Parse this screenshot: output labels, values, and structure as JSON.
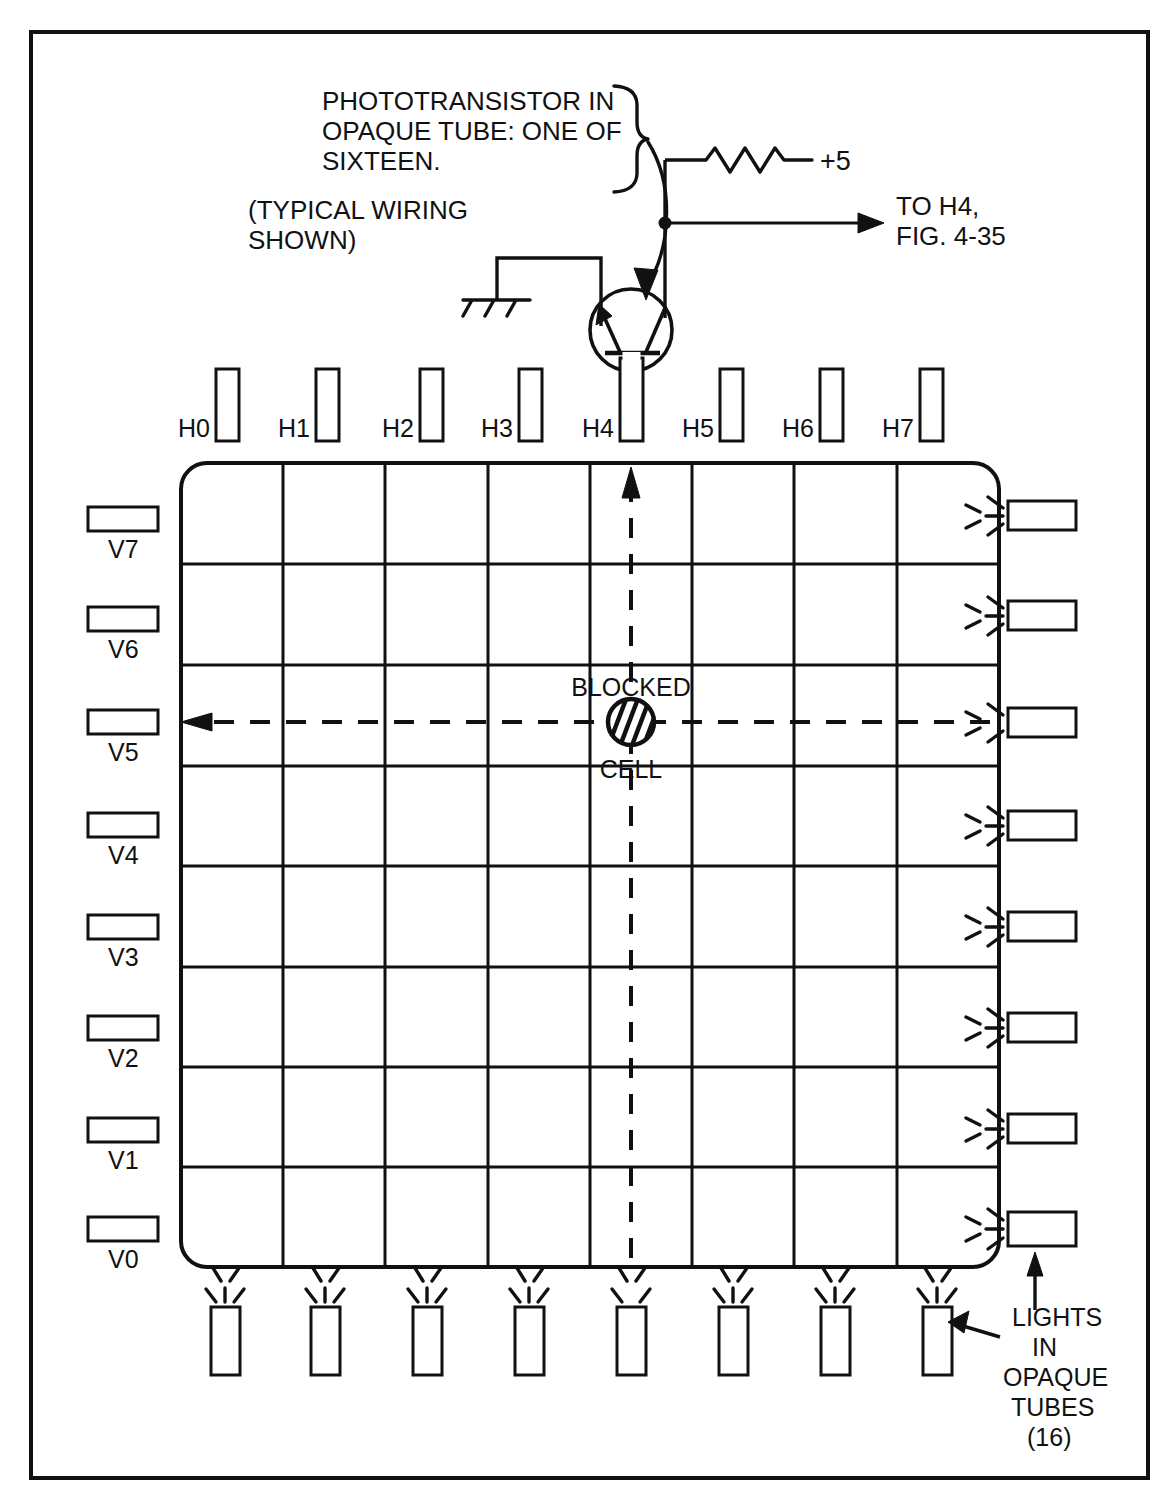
{
  "figure": {
    "frame": {
      "name": "outer-border"
    }
  },
  "callout": {
    "phototransistor_note": [
      "PHOTOTRANSISTOR IN",
      "OPAQUE TUBE: ONE OF",
      "SIXTEEN."
    ],
    "typical_wiring_note": [
      "(TYPICAL WIRING",
      "SHOWN)"
    ]
  },
  "circuit": {
    "supply_label": "+5",
    "output_label": [
      "TO H4,",
      "FIG. 4-35"
    ],
    "resistor_name": "pull-up-resistor",
    "ground_name": "chassis-ground",
    "transistor_name": "phototransistor",
    "junction_name": "wire-junction-dot"
  },
  "grid": {
    "columns": 8,
    "rows": 8,
    "blocked_cell": {
      "label_top": "BLOCKED",
      "label_bottom": "CELL",
      "column_index": 4,
      "row_index": 5
    },
    "beam_vertical_source": "H4",
    "beam_horizontal_target": "V5"
  },
  "sensors": {
    "horizontal_labels": [
      "H0",
      "H1",
      "H2",
      "H3",
      "H4",
      "H5",
      "H6",
      "H7"
    ],
    "vertical_labels": [
      "V7",
      "V6",
      "V5",
      "V4",
      "V3",
      "V2",
      "V1",
      "V0"
    ]
  },
  "lights_caption": {
    "lines": [
      "LIGHTS",
      "IN",
      "OPAQUE",
      "TUBES",
      "(16)"
    ]
  },
  "colors": {
    "ink": "#111111",
    "paper": "#ffffff"
  }
}
